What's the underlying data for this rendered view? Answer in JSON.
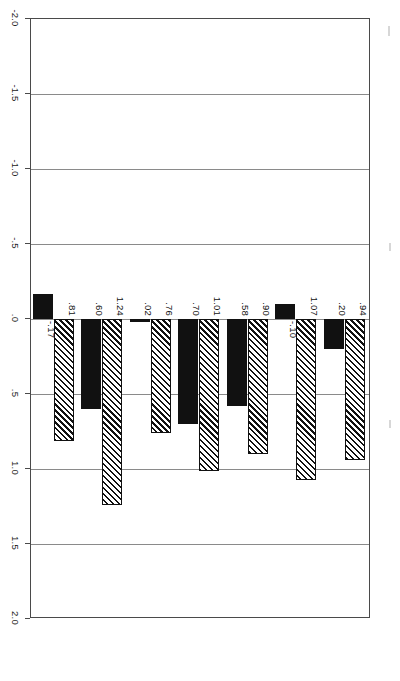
{
  "chart_data": {
    "type": "bar",
    "orientation": "horizontal",
    "title": "",
    "subtitle": "",
    "xlabel": "",
    "ylabel": "",
    "xlim": [
      -2.0,
      2.0
    ],
    "grid": true,
    "legend_position": "none",
    "axis_tick_labels": [
      "2.0",
      "1.5",
      "1.0",
      ".5",
      ".0",
      "-.5",
      "-1.0",
      "-1.5",
      "-2.0"
    ],
    "axis_tick_values": [
      2.0,
      1.5,
      1.0,
      0.5,
      0.0,
      -0.5,
      -1.0,
      -1.5,
      -2.0
    ],
    "categories": [
      "OVERALL MEAN",
      "Symbols",
      "Structure",
      "Individualized Support",
      "Intellectual Stimulation",
      "Performance\nExpectations",
      "Vision and Objectives"
    ],
    "series": [
      {
        "name": "series-hatched",
        "pattern": "diagonal-hatch",
        "values": [
          0.94,
          1.07,
          0.9,
          1.01,
          0.76,
          1.24,
          0.81
        ],
        "labels": [
          ".94",
          "1.07",
          ".90",
          "1.01",
          ".76",
          "1.24",
          ".81"
        ]
      },
      {
        "name": "series-solid",
        "pattern": "solid-black",
        "values": [
          0.2,
          -0.1,
          0.58,
          0.7,
          0.02,
          0.6,
          -0.17
        ],
        "labels": [
          ".20",
          "-.10",
          ".58",
          ".70",
          ".02",
          ".60",
          "-.17"
        ]
      }
    ],
    "colors": {
      "hatch_fg": "#111111",
      "hatch_bg": "#ffffff",
      "solid": "#111111",
      "grid": "#8a8a8a",
      "frame": "#4a4a4a",
      "text": "#1a1a1a"
    }
  }
}
